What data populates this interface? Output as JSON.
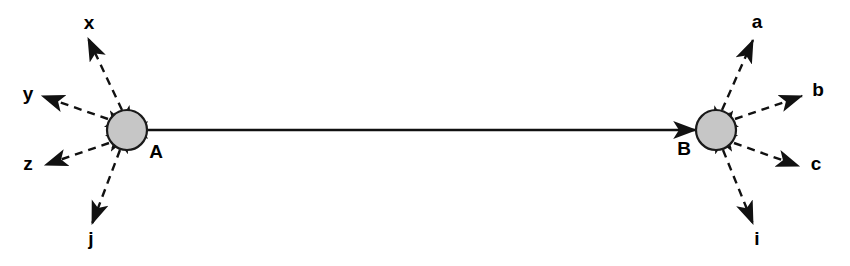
{
  "diagram": {
    "background_color": "#ffffff",
    "line_color": "#111111",
    "node_fill_color": "#c6c6c6",
    "node_stroke_color": "#1a1a1a",
    "canvas": {
      "width": 850,
      "height": 266
    },
    "nodes": [
      {
        "id": "A",
        "label": "A",
        "cx": 127,
        "cy": 130,
        "r": 20,
        "label_x": 156,
        "label_y": 153,
        "label_anchor": "middle"
      },
      {
        "id": "B",
        "label": "B",
        "cx": 716,
        "cy": 130,
        "r": 20,
        "label_x": 684,
        "label_y": 150,
        "label_anchor": "middle"
      }
    ],
    "main_edge": {
      "id": "A-B",
      "from": "A",
      "to": "B",
      "style": "solid",
      "arrowheads": "both",
      "x1": 147,
      "y1": 130,
      "x2": 696,
      "y2": 130
    },
    "spokes": [
      {
        "id": "A-x",
        "node": "A",
        "label": "x",
        "style": "dashed",
        "arrowheads": "both",
        "x1": 122,
        "y1": 110,
        "x2": 88,
        "y2": 38,
        "label_x": 89,
        "label_y": 24
      },
      {
        "id": "A-y",
        "node": "A",
        "label": "y",
        "style": "dashed",
        "arrowheads": "both",
        "x1": 108,
        "y1": 119,
        "x2": 42,
        "y2": 96,
        "label_x": 28,
        "label_y": 95
      },
      {
        "id": "A-z",
        "node": "A",
        "label": "z",
        "style": "dashed",
        "arrowheads": "both",
        "x1": 109,
        "y1": 143,
        "x2": 45,
        "y2": 165,
        "label_x": 28,
        "label_y": 165
      },
      {
        "id": "A-j",
        "node": "A",
        "label": "j",
        "style": "dashed",
        "arrowheads": "both",
        "x1": 120,
        "y1": 150,
        "x2": 92,
        "y2": 224,
        "label_x": 91,
        "label_y": 240
      },
      {
        "id": "B-a",
        "node": "B",
        "label": "a",
        "style": "dashed",
        "arrowheads": "both",
        "x1": 722,
        "y1": 110,
        "x2": 753,
        "y2": 40,
        "label_x": 757,
        "label_y": 23
      },
      {
        "id": "B-b",
        "node": "B",
        "label": "b",
        "style": "dashed",
        "arrowheads": "both",
        "x1": 735,
        "y1": 119,
        "x2": 802,
        "y2": 96,
        "label_x": 818,
        "label_y": 91
      },
      {
        "id": "B-c",
        "node": "B",
        "label": "c",
        "style": "dashed",
        "arrowheads": "both",
        "x1": 734,
        "y1": 143,
        "x2": 799,
        "y2": 166,
        "label_x": 816,
        "label_y": 165
      },
      {
        "id": "B-i",
        "node": "B",
        "label": "i",
        "style": "dashed",
        "arrowheads": "both",
        "x1": 723,
        "y1": 150,
        "x2": 753,
        "y2": 224,
        "label_x": 757,
        "label_y": 240
      }
    ]
  }
}
